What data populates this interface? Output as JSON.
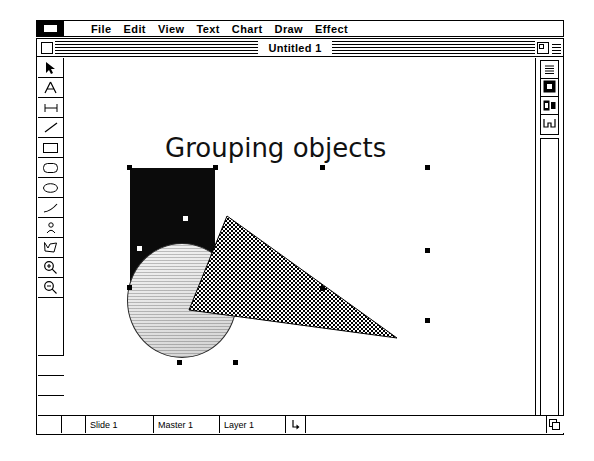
{
  "app": {
    "title": "Untitled 1",
    "apple_menu_icon": "apple-menu-icon"
  },
  "menubar": {
    "items": [
      {
        "label": "File",
        "name": "menu-file"
      },
      {
        "label": "Edit",
        "name": "menu-edit"
      },
      {
        "label": "View",
        "name": "menu-view"
      },
      {
        "label": "Text",
        "name": "menu-text"
      },
      {
        "label": "Chart",
        "name": "menu-chart"
      },
      {
        "label": "Draw",
        "name": "menu-draw"
      },
      {
        "label": "Effect",
        "name": "menu-effect"
      }
    ]
  },
  "toolpalette": {
    "tools": [
      {
        "name": "pointer-tool",
        "icon": "arrow-pointer-icon",
        "selected": true
      },
      {
        "name": "text-tool",
        "icon": "letter-a-icon",
        "selected": false
      },
      {
        "name": "dimension-tool",
        "icon": "line-segment-icon",
        "selected": false
      },
      {
        "name": "line-tool",
        "icon": "diagonal-line-icon",
        "selected": false
      },
      {
        "name": "rectangle-tool",
        "icon": "rectangle-icon",
        "selected": false
      },
      {
        "name": "rounded-rectangle-tool",
        "icon": "rounded-rectangle-icon",
        "selected": false
      },
      {
        "name": "ellipse-tool",
        "icon": "ellipse-icon",
        "selected": false
      },
      {
        "name": "arc-tool",
        "icon": "arc-curve-icon",
        "selected": false
      },
      {
        "name": "freehand-tool",
        "icon": "freehand-person-icon",
        "selected": false
      },
      {
        "name": "polygon-tool",
        "icon": "polygon-icon",
        "selected": false
      },
      {
        "name": "zoom-in-tool",
        "icon": "magnifier-plus-icon",
        "selected": false
      },
      {
        "name": "zoom-out-tool",
        "icon": "magnifier-minus-icon",
        "selected": false
      }
    ]
  },
  "right_palette": {
    "buttons": [
      {
        "name": "view-mode-wireframe-button",
        "icon": "lines-stack-icon"
      },
      {
        "name": "view-mode-solid-button",
        "icon": "filled-square-icon"
      },
      {
        "name": "view-mode-preview-button",
        "icon": "square-pair-icon"
      },
      {
        "name": "layer-link-button",
        "icon": "bracket-icon"
      }
    ]
  },
  "canvas": {
    "slide_title": "Grouping objects",
    "objects": [
      {
        "name": "black-rectangle-object",
        "shape": "rectangle",
        "fill": "#0b0b0b"
      },
      {
        "name": "gray-circle-object",
        "shape": "circle",
        "fill": "#e6e6e6"
      },
      {
        "name": "checkered-cone-object",
        "shape": "cone",
        "fill": "checker-pattern"
      }
    ],
    "selection": {
      "active": true,
      "handle_color": "#000000",
      "handle_count": 8
    }
  },
  "statusbar": {
    "slide": "Slide 1",
    "master": "Master 1",
    "layer": "Layer 1",
    "loop_icon": "loop-arrow-icon"
  },
  "titlebar": {
    "close_box": "close-box",
    "zoom_box": "zoom-box"
  },
  "colors": {
    "window_bg": "#ffffff",
    "frame": "#000000",
    "object_black": "#0b0b0b",
    "object_gray": "#e6e6e6"
  }
}
